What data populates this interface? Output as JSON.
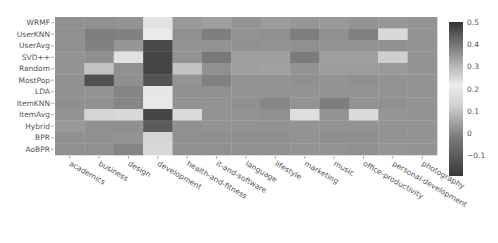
{
  "chart_data": {
    "type": "heatmap",
    "title": "",
    "xlabel": "",
    "ylabel": "",
    "rows": [
      "WRMF",
      "UserKNN",
      "UserAvg",
      "SVD++",
      "Random",
      "MostPop",
      "LDA",
      "ItemKNN",
      "ItemAvg",
      "Hybrid",
      "BPR",
      "AoBPR"
    ],
    "columns": [
      "academics",
      "business",
      "design",
      "development",
      "health-and-fitness",
      "it-and-software",
      "language",
      "lifestyle",
      "marketing",
      "music",
      "office-productivity",
      "personal-development",
      "photography"
    ],
    "values": [
      [
        0.02,
        0.02,
        0.03,
        0.18,
        0.05,
        0.07,
        0.03,
        0.06,
        0.04,
        0.05,
        0.03,
        0.04,
        0.03
      ],
      [
        0.02,
        -0.04,
        -0.03,
        0.22,
        0.02,
        -0.04,
        0.03,
        0.02,
        -0.04,
        0.02,
        -0.03,
        0.15,
        0.03
      ],
      [
        0.02,
        -0.03,
        0.04,
        -0.15,
        0.03,
        0.03,
        0.02,
        0.03,
        0.02,
        0.03,
        0.03,
        0.02,
        0.03
      ],
      [
        0.03,
        0.02,
        0.18,
        -0.16,
        0.03,
        -0.06,
        0.07,
        0.07,
        -0.05,
        0.07,
        0.07,
        0.12,
        0.03
      ],
      [
        0.03,
        0.1,
        0.02,
        -0.16,
        0.1,
        0.02,
        0.07,
        0.08,
        0.03,
        0.06,
        0.06,
        0.05,
        0.03
      ],
      [
        0.02,
        -0.13,
        0.02,
        -0.12,
        0.03,
        -0.03,
        0.03,
        0.03,
        0.02,
        0.03,
        0.02,
        0.03,
        0.03
      ],
      [
        0.02,
        0.03,
        -0.02,
        0.2,
        0.02,
        0.02,
        0.03,
        0.03,
        0.03,
        0.03,
        0.03,
        0.03,
        0.03
      ],
      [
        0.02,
        0.02,
        -0.01,
        0.2,
        0.03,
        0.03,
        0.02,
        -0.01,
        0.03,
        -0.04,
        0.03,
        0.02,
        0.03
      ],
      [
        0.03,
        0.14,
        0.15,
        -0.16,
        0.16,
        0.03,
        0.03,
        0.02,
        0.17,
        0.03,
        0.16,
        0.04,
        0.03
      ],
      [
        0.05,
        0.02,
        0.02,
        -0.1,
        0.02,
        0.03,
        0.03,
        0.03,
        0.03,
        0.03,
        0.03,
        0.03,
        0.03
      ],
      [
        0.02,
        0.02,
        0.03,
        0.14,
        0.02,
        0.02,
        0.02,
        0.02,
        0.03,
        0.02,
        0.02,
        0.03,
        0.03
      ],
      [
        0.02,
        0.02,
        -0.02,
        0.15,
        0.02,
        0.02,
        0.02,
        0.02,
        0.03,
        0.03,
        0.02,
        0.04,
        0.03
      ]
    ],
    "colorbar": {
      "ticks": [
        0.5,
        0.4,
        0.3,
        0.2,
        0.1,
        0,
        -0.1
      ],
      "tick_labels": [
        "0.5",
        "0.4",
        "0.3",
        "0.2",
        "0.1",
        "0",
        "−0.1"
      ],
      "range": [
        -0.19,
        0.5
      ]
    },
    "grid": false,
    "legend_position": "right"
  }
}
